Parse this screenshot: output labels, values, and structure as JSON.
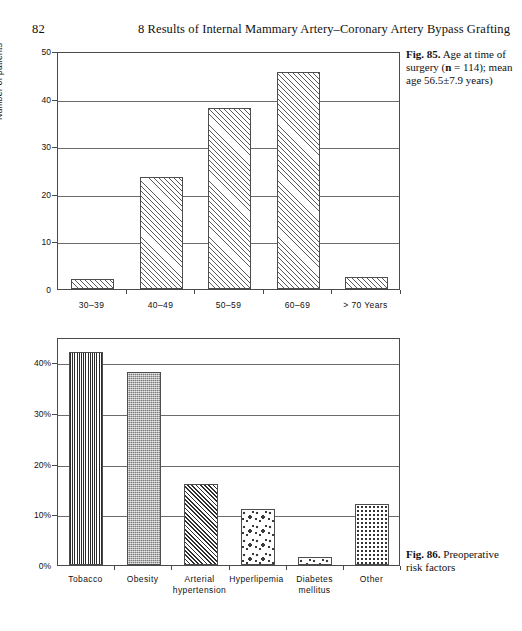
{
  "page": {
    "folio": "82",
    "running_head": "8  Results of Internal Mammary Artery–Coronary Artery Bypass Grafting"
  },
  "captions": {
    "fig85": {
      "label": "Fig. 85.",
      "text": " Age at time of surgery (",
      "bold_n": "n",
      "text2": " = 114); mean age 56.5±7.9 years)"
    },
    "fig86": {
      "label": "Fig. 86.",
      "text": " Preoperative risk factors"
    }
  },
  "chart_data": [
    {
      "type": "bar",
      "id": "fig85-age-at-surgery",
      "title": "Age at time of surgery",
      "xlabel": "",
      "ylabel": "Number of patients",
      "ylim": [
        0,
        50
      ],
      "yticks": [
        "0",
        "10",
        "20",
        "30",
        "40",
        "50"
      ],
      "ytick_values": [
        0,
        10,
        20,
        30,
        40,
        50
      ],
      "grid": true,
      "legend": "none",
      "categories": [
        "30–39",
        "40–49",
        "50–59",
        "60–69",
        "> 70 Years"
      ],
      "values": [
        2,
        23.5,
        38,
        45.5,
        2.5
      ],
      "fills": [
        "diag45",
        "diag45",
        "diag45",
        "diag45",
        "diag45"
      ]
    },
    {
      "type": "bar",
      "id": "fig86-preoperative-risk-factors",
      "title": "Preoperative risk factors",
      "xlabel": "",
      "ylabel": "",
      "ylim": [
        0,
        45
      ],
      "yticks": [
        "0%",
        "10%",
        "20%",
        "30%",
        "40%"
      ],
      "ytick_values": [
        0,
        10,
        20,
        30,
        40
      ],
      "grid": true,
      "legend": "none",
      "categories": [
        "Tobacco",
        "Obesity",
        "Arterial hypertension",
        "Hyperlipemia",
        "Diabetes mellitus",
        "Other"
      ],
      "values": [
        42,
        38,
        16,
        11,
        1.5,
        12
      ],
      "fills": [
        "vertwave",
        "checker",
        "diagdense",
        "speckle",
        "speckle",
        "dots"
      ]
    }
  ]
}
